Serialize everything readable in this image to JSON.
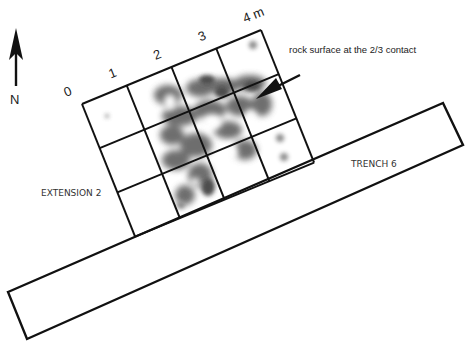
{
  "north_arrow": {
    "label": "N"
  },
  "grid": {
    "columns": 4,
    "rows": 3,
    "scale_ticks": [
      "0",
      "1",
      "2",
      "3",
      "4 m"
    ]
  },
  "labels": {
    "extension": "EXTENSION 2",
    "trench": "TRENCH 6",
    "annotation": "rock surface at the 2/3 contact"
  },
  "colors": {
    "line": "#111111",
    "stain": "#3a3a3a",
    "background": "#ffffff"
  }
}
